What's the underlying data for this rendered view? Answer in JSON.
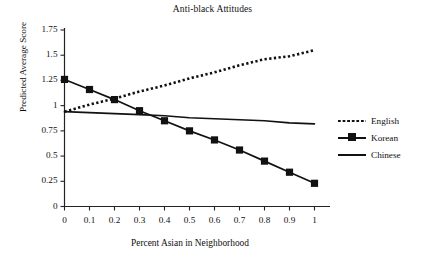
{
  "chart_data": {
    "type": "line",
    "title": "Anti-black Attitudes",
    "xlabel": "Percent Asian in Neighborhood",
    "ylabel": "Predicted Average Score",
    "grid": false,
    "legend_position": "right",
    "xlim": [
      0,
      1
    ],
    "ylim": [
      0,
      1.75
    ],
    "x": [
      0,
      0.1,
      0.2,
      0.3,
      0.4,
      0.5,
      0.6,
      0.7,
      0.8,
      0.9,
      1
    ],
    "xtick_labels": [
      "0",
      "0.1",
      "0.2",
      "0.3",
      "0.4",
      "0.5",
      "0.6",
      "0.7",
      "0.8",
      "0.9",
      "1"
    ],
    "ytick_labels": [
      "0",
      "0.25",
      "0.5",
      "0.75",
      "1",
      "1.25",
      "1.5",
      "1.75"
    ],
    "ytick_values": [
      0,
      0.25,
      0.5,
      0.75,
      1,
      1.25,
      1.5,
      1.75
    ],
    "series": [
      {
        "name": "English",
        "style": "dotted",
        "marker": "none",
        "values": [
          0.94,
          1.01,
          1.07,
          1.14,
          1.2,
          1.27,
          1.33,
          1.4,
          1.46,
          1.49,
          1.55
        ]
      },
      {
        "name": "Korean",
        "style": "solid",
        "marker": "square",
        "values": [
          1.26,
          1.16,
          1.06,
          0.95,
          0.85,
          0.75,
          0.66,
          0.56,
          0.45,
          0.34,
          0.23
        ]
      },
      {
        "name": "Chinese",
        "style": "solid",
        "marker": "none",
        "values": [
          0.94,
          0.93,
          0.92,
          0.91,
          0.9,
          0.88,
          0.87,
          0.86,
          0.85,
          0.83,
          0.82
        ]
      }
    ]
  },
  "legend": {
    "items": [
      {
        "label": "English"
      },
      {
        "label": "Korean"
      },
      {
        "label": "Chinese"
      }
    ]
  },
  "colors": {
    "axis": "#222222",
    "series": "#111111",
    "background": "#ffffff"
  }
}
